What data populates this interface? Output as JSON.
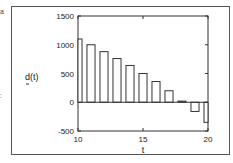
{
  "chart_data": {
    "type": "bar",
    "title": "",
    "xlabel": "t",
    "ylabel": "d(t)",
    "x": [
      10,
      11,
      12,
      13,
      14,
      15,
      16,
      17,
      18,
      19,
      20
    ],
    "values": [
      1100,
      1000,
      880,
      760,
      640,
      500,
      360,
      200,
      20,
      -160,
      -350
    ],
    "xlim": [
      10,
      20
    ],
    "ylim": [
      -500,
      1500
    ],
    "xticks": [
      "10",
      "15",
      "20"
    ],
    "yticks": [
      "1500",
      "1000",
      "500",
      "0",
      "-500"
    ],
    "grid": false,
    "legend": null
  }
}
